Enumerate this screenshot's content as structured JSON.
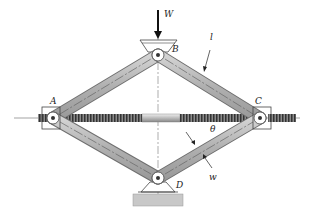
{
  "diagram": {
    "labels": {
      "load": "W",
      "top_pin": "B",
      "left_pin": "A",
      "right_pin": "C",
      "bottom_pin": "D",
      "link_length": "l",
      "link_width": "w",
      "angle": "θ"
    },
    "points": {
      "A": [
        53,
        118
      ],
      "B": [
        158,
        55
      ],
      "C": [
        260,
        118
      ],
      "D": [
        158,
        178
      ]
    },
    "colors": {
      "link_fill": "#b9b9b9",
      "link_edge": "#6f6f6f",
      "screw": "#555555",
      "base": "#c8c8c8",
      "text": "#222222"
    }
  }
}
